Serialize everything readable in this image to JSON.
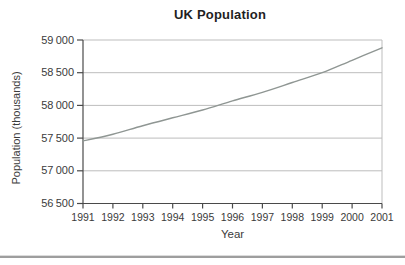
{
  "chart_data": {
    "type": "line",
    "title": "UK Population",
    "xlabel": "Year",
    "ylabel": "Population (thousands)",
    "categories": [
      1991,
      1992,
      1993,
      1994,
      1995,
      1996,
      1997,
      1998,
      1999,
      2000,
      2001
    ],
    "values": [
      57455,
      57560,
      57690,
      57810,
      57930,
      58070,
      58200,
      58350,
      58500,
      58690,
      58880
    ],
    "ylim": [
      56500,
      59000
    ],
    "ytick_step": 500,
    "ytick_labels": [
      "56 500",
      "57 000",
      "57 500",
      "58 000",
      "58 500",
      "59 000"
    ],
    "grid": "horizontal",
    "legend": "none",
    "colors": {
      "line": "#8f9693",
      "grid": "#bdbdbd",
      "axis": "#4a4a4a",
      "text": "#3b3b3b",
      "title": "#1f1f1f"
    }
  }
}
